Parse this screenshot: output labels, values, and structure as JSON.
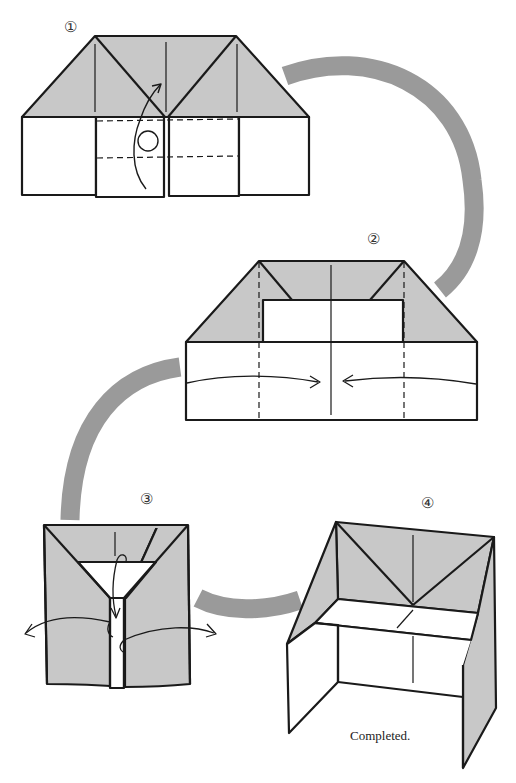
{
  "diagram": {
    "type": "origami-instructions",
    "colors": {
      "paper_colored": "#c8c8c8",
      "paper_white": "#ffffff",
      "line": "#1a1a1a",
      "flow_arc": "#9a9a9a"
    },
    "steps": [
      {
        "number": "1",
        "label": "①"
      },
      {
        "number": "2",
        "label": "②"
      },
      {
        "number": "3",
        "label": "③"
      },
      {
        "number": "4",
        "label": "④"
      }
    ],
    "caption": "Completed."
  }
}
